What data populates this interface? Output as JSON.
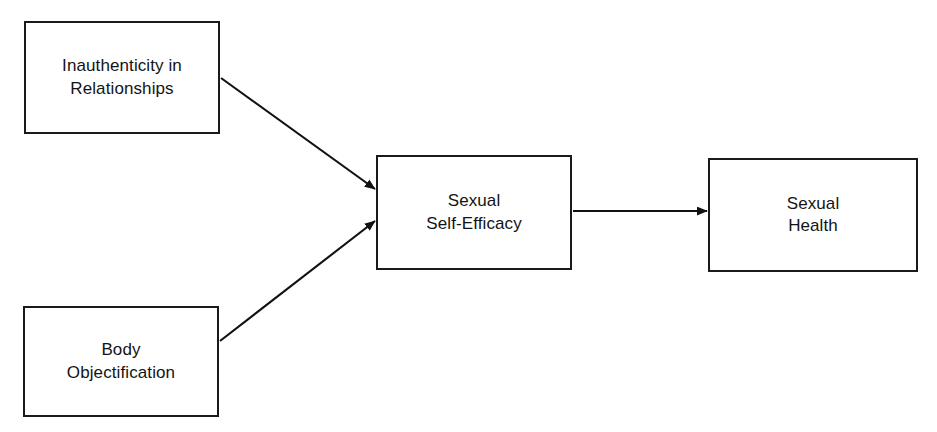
{
  "diagram": {
    "type": "path-model",
    "stroke_color": "#1a1a1a",
    "background_color": "#ffffff",
    "nodes": [
      {
        "id": "inauthenticity",
        "label": "Inauthenticity in\nRelationships",
        "role": "predictor",
        "x": 24,
        "y": 21,
        "width": 196,
        "height": 113
      },
      {
        "id": "body",
        "label": "Body\nObjectification",
        "role": "predictor",
        "x": 23,
        "y": 306,
        "width": 196,
        "height": 111
      },
      {
        "id": "efficacy",
        "label": "Sexual\nSelf-Efficacy",
        "role": "mediator",
        "x": 376,
        "y": 155,
        "width": 196,
        "height": 115
      },
      {
        "id": "health",
        "label": "Sexual\nHealth",
        "role": "outcome",
        "x": 708,
        "y": 158,
        "width": 210,
        "height": 114
      }
    ],
    "edges": [
      {
        "id": "edge-inauthenticity-to-efficacy",
        "from": "inauthenticity",
        "to": "efficacy",
        "style": "solid-arrow",
        "label": ""
      },
      {
        "id": "edge-body-to-efficacy",
        "from": "body",
        "to": "efficacy",
        "style": "solid-arrow",
        "label": ""
      },
      {
        "id": "edge-efficacy-to-health",
        "from": "efficacy",
        "to": "health",
        "style": "solid-arrow",
        "label": ""
      }
    ]
  }
}
